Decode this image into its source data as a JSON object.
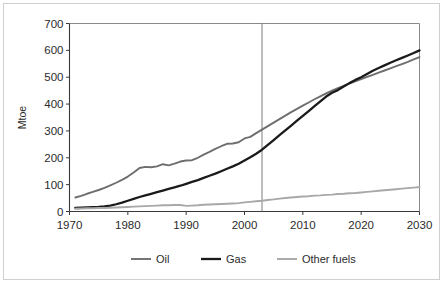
{
  "figure": {
    "title": "",
    "axis_label_color": "#2b2b2b",
    "frame_color": "#cfcfcf",
    "background": "#ffffff"
  },
  "chart_data": {
    "type": "line",
    "title": "",
    "xlabel": "",
    "ylabel": "Mtoe",
    "xlim": [
      1970,
      2030
    ],
    "ylim": [
      0,
      700
    ],
    "xticks": [
      1970,
      1980,
      1990,
      2000,
      2010,
      2020,
      2030
    ],
    "xtick_labels": [
      "1970",
      "1980",
      "1990",
      "2000",
      "2010",
      "2020",
      "2030"
    ],
    "yticks": [
      0,
      100,
      200,
      300,
      400,
      500,
      600,
      700
    ],
    "ytick_labels": [
      "0",
      "100",
      "200",
      "300",
      "400",
      "500",
      "600",
      "700"
    ],
    "grid": false,
    "legend_position": "below",
    "divider": {
      "x": 2003,
      "label": "",
      "color": "#6e6e6e"
    },
    "x": [
      1971,
      1972,
      1973,
      1974,
      1975,
      1976,
      1977,
      1978,
      1979,
      1980,
      1981,
      1982,
      1983,
      1984,
      1985,
      1986,
      1987,
      1988,
      1989,
      1990,
      1991,
      1992,
      1993,
      1994,
      1995,
      1996,
      1997,
      1998,
      1999,
      2000,
      2001,
      2002,
      2003,
      2004,
      2005,
      2006,
      2007,
      2008,
      2009,
      2010,
      2011,
      2012,
      2013,
      2014,
      2015,
      2016,
      2017,
      2018,
      2019,
      2020,
      2021,
      2022,
      2023,
      2024,
      2025,
      2026,
      2027,
      2028,
      2029,
      2030
    ],
    "series": [
      {
        "name": "Oil",
        "color": "#6e6e6e",
        "width": 1.9,
        "values": [
          52,
          58,
          66,
          73,
          80,
          88,
          97,
          107,
          118,
          130,
          145,
          162,
          166,
          165,
          168,
          176,
          172,
          178,
          186,
          190,
          191,
          200,
          212,
          222,
          233,
          243,
          252,
          253,
          258,
          272,
          278,
          292,
          305,
          318,
          331,
          344,
          357,
          370,
          382,
          394,
          406,
          418,
          429,
          440,
          450,
          459,
          468,
          477,
          485,
          493,
          501,
          509,
          517,
          525,
          533,
          541,
          549,
          557,
          566,
          575
        ]
      },
      {
        "name": "Gas",
        "color": "#1a1a1a",
        "width": 2.3,
        "values": [
          13,
          14,
          15,
          16,
          17,
          19,
          22,
          27,
          33,
          40,
          47,
          54,
          60,
          66,
          72,
          78,
          84,
          90,
          96,
          103,
          110,
          117,
          125,
          133,
          141,
          150,
          159,
          168,
          178,
          190,
          202,
          215,
          230,
          248,
          266,
          284,
          302,
          320,
          338,
          356,
          374,
          392,
          410,
          428,
          442,
          452,
          465,
          478,
          490,
          500,
          512,
          524,
          534,
          544,
          554,
          563,
          572,
          581,
          590,
          600
        ]
      },
      {
        "name": "Other fuels",
        "color": "#a8a8a8",
        "width": 1.9,
        "values": [
          10,
          11,
          12,
          12,
          13,
          13,
          14,
          15,
          16,
          17,
          18,
          19,
          20,
          21,
          22,
          23,
          23,
          24,
          24,
          21,
          22,
          23,
          25,
          26,
          27,
          28,
          29,
          30,
          31,
          34,
          36,
          38,
          40,
          43,
          45,
          48,
          50,
          52,
          54,
          56,
          57,
          59,
          60,
          62,
          63,
          65,
          66,
          68,
          69,
          71,
          73,
          75,
          77,
          79,
          81,
          83,
          85,
          87,
          89,
          91
        ]
      }
    ]
  },
  "legend": {
    "items": [
      {
        "label": "Oil",
        "color": "#6e6e6e"
      },
      {
        "label": "Gas",
        "color": "#1a1a1a"
      },
      {
        "label": "Other fuels",
        "color": "#a8a8a8"
      }
    ]
  }
}
